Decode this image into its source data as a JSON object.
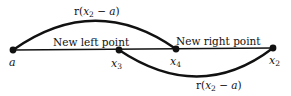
{
  "diagram": {
    "type": "golden-section-search-interval",
    "colors": {
      "stroke": "#111111",
      "background": "#ffffff"
    },
    "baseline": {
      "from": "a",
      "to": "x2"
    },
    "points": [
      {
        "id": "a",
        "label": "a",
        "subscript": "",
        "x": 13,
        "y": 50
      },
      {
        "id": "x3",
        "label": "x",
        "subscript": "3",
        "x": 119,
        "y": 50
      },
      {
        "id": "x4",
        "label": "x",
        "subscript": "4",
        "x": 176,
        "y": 49
      },
      {
        "id": "x2",
        "label": "x",
        "subscript": "2",
        "x": 273,
        "y": 48
      }
    ],
    "annotations": {
      "new_left_point": "New left point",
      "new_right_point": "New right point"
    },
    "arcs": [
      {
        "id": "upper-arc",
        "from": "a",
        "to": "x4",
        "side": "above",
        "label": {
          "prefix": "r(",
          "var": "x",
          "subscript": "2",
          "rest": " − ",
          "var2": "a",
          "suffix": ")"
        }
      },
      {
        "id": "lower-arc",
        "from": "x3",
        "to": "x2",
        "side": "below",
        "label": {
          "prefix": "r(",
          "var": "x",
          "subscript": "2",
          "rest": " − ",
          "var2": "a",
          "suffix": ")"
        }
      }
    ]
  }
}
